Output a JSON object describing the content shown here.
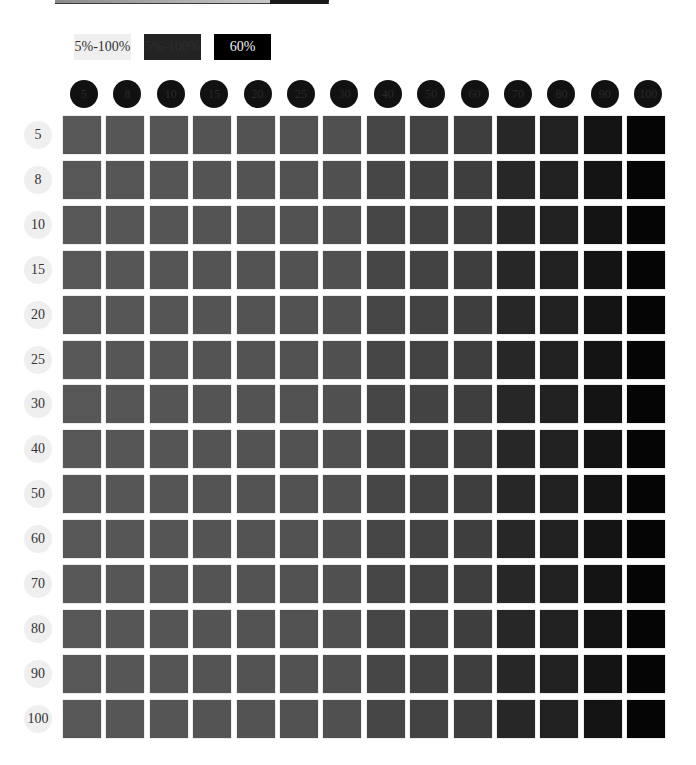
{
  "legend": {
    "items": [
      {
        "label": "5%-100%",
        "style": "light"
      },
      {
        "label": "5%-100%",
        "style": "dark"
      },
      {
        "label": "60%",
        "style": "black"
      }
    ]
  },
  "columns": [
    "5",
    "8",
    "10",
    "15",
    "20",
    "25",
    "30",
    "40",
    "50",
    "60",
    "70",
    "80",
    "90",
    "100"
  ],
  "rows": [
    "5",
    "8",
    "10",
    "15",
    "20",
    "25",
    "30",
    "40",
    "50",
    "60",
    "70",
    "80",
    "90",
    "100"
  ],
  "column_colors": [
    "#575757",
    "#565656",
    "#555555",
    "#545454",
    "#535353",
    "#525252",
    "#505050",
    "#464646",
    "#434343",
    "#3e3e3e",
    "#272727",
    "#212121",
    "#141414",
    "#050505"
  ],
  "colors": {
    "legend_light": "#efefef",
    "legend_dark": "#232323",
    "legend_black": "#000000",
    "column_circle": "#111111",
    "row_circle": "#efefef"
  }
}
